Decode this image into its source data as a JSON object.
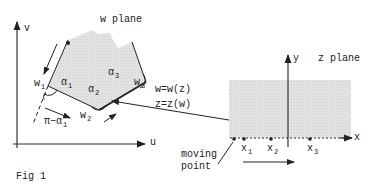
{
  "figure": {
    "caption": "Fig 1",
    "w_plane": {
      "title": "w plane",
      "axis_v": "v",
      "axis_u": "u",
      "vertices": [
        {
          "name": "w",
          "sub": "1"
        },
        {
          "name": "w",
          "sub": "2"
        },
        {
          "name": "w",
          "sub": "3"
        }
      ],
      "angles": [
        {
          "name": "α",
          "sub": "1"
        },
        {
          "name": "α",
          "sub": "2"
        },
        {
          "name": "α",
          "sub": "3"
        }
      ],
      "exterior_angle": "π−α",
      "exterior_angle_sub": "1"
    },
    "mapping": {
      "forward": "w=w(z)",
      "inverse": "z=z(w)"
    },
    "z_plane": {
      "title": "z plane",
      "axis_y": "y",
      "axis_x": "x",
      "points": [
        {
          "name": "x",
          "sub": "1"
        },
        {
          "name": "x",
          "sub": "2"
        },
        {
          "name": "x",
          "sub": "3"
        }
      ],
      "moving_point_line1": "moving",
      "moving_point_line2": "point"
    }
  }
}
